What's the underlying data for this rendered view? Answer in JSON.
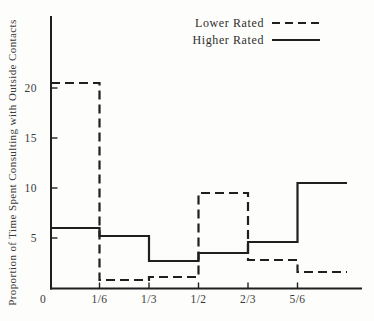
{
  "chart_data": {
    "type": "line",
    "subtype": "step",
    "title": "",
    "xlabel": "",
    "ylabel": "Proportion of Time Spent Consulting with Outside Contacts",
    "x_ticks": [
      "0",
      "1/6",
      "1/3",
      "1/2",
      "2/3",
      "5/6"
    ],
    "x_tick_values": [
      0,
      0.16667,
      0.33333,
      0.5,
      0.66667,
      0.83333
    ],
    "y_ticks": [
      0,
      5,
      10,
      15,
      20
    ],
    "xlim": [
      0,
      1.05
    ],
    "ylim": [
      0,
      27
    ],
    "grid": false,
    "legend_position": "top-right",
    "segments_x": [
      [
        0,
        0.16667
      ],
      [
        0.16667,
        0.33333
      ],
      [
        0.33333,
        0.5
      ],
      [
        0.5,
        0.66667
      ],
      [
        0.66667,
        0.83333
      ],
      [
        0.83333,
        1.0
      ]
    ],
    "series": [
      {
        "name": "Lower Rated",
        "style": "dashed",
        "values": [
          20.5,
          0.8,
          1.1,
          9.5,
          2.8,
          1.6
        ]
      },
      {
        "name": "Higher Rated",
        "style": "solid",
        "values": [
          6.0,
          5.2,
          2.7,
          3.5,
          4.6,
          10.5
        ]
      }
    ],
    "colors": {
      "ink": "#1f1f1f",
      "text": "#3a3a3a",
      "background": "#fdfdfb"
    }
  }
}
